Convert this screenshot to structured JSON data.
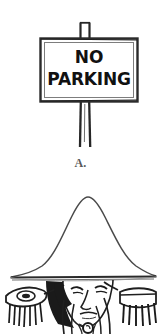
{
  "figure": {
    "background_color": "#ffffff",
    "ink_color": "#1a1a1a",
    "caption_color": "#5a5a5a",
    "panels": [
      {
        "id": "A",
        "caption": "A.",
        "subject": "no-parking-sign",
        "sign": {
          "line1": "NO",
          "line2": "PARKING",
          "text_color": "#111111",
          "board_fill": "#ffffff",
          "border_color": "#2b2b2b"
        },
        "post": {
          "top_stub": "post-top-stub",
          "shaft": "post-shaft"
        }
      },
      {
        "id": "B",
        "caption": "",
        "subject": "napoleon-bust-portrait",
        "elements": [
          "bicorne-hat",
          "face",
          "collar",
          "left-epaulette",
          "right-epaulette",
          "uniform-coat"
        ]
      }
    ]
  }
}
